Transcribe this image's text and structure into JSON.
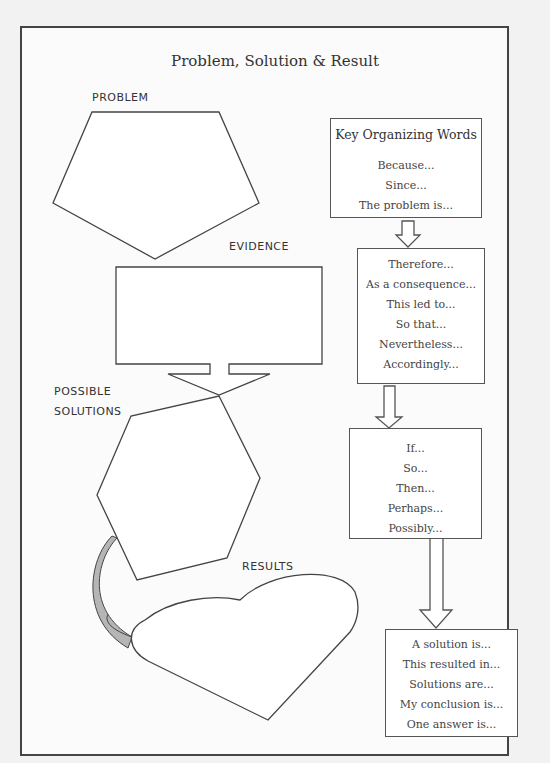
{
  "title": "Problem, Solution  & Result",
  "labels": {
    "problem": "PROBLEM",
    "evidence": "EVIDENCE",
    "possible_solutions_1": "POSSIBLE",
    "possible_solutions_2": "SOLUTIONS",
    "results": "RESULTS"
  },
  "key_words": {
    "heading": "Key Organizing Words",
    "box1": [
      "Because...",
      "Since...",
      "The problem is..."
    ],
    "box2": [
      "Therefore...",
      "As a consequence...",
      "This led to...",
      "So that...",
      "Nevertheless...",
      "Accordingly..."
    ],
    "box3": [
      "If...",
      "So...",
      "Then...",
      "Perhaps...",
      "Possibly..."
    ],
    "box4": [
      "A solution is...",
      "This resulted in...",
      "Solutions are...",
      "My conclusion is...",
      "One answer is..."
    ]
  },
  "colors": {
    "stroke": "#444444",
    "connector_fill": "#b5b5b5",
    "background": "#f2f2f2"
  }
}
